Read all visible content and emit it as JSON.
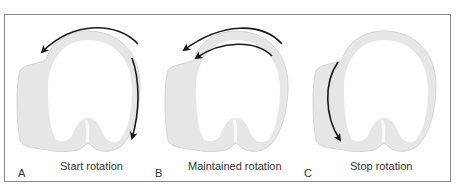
{
  "figure": {
    "panels": [
      {
        "letter": "A",
        "caption": "Start rotation"
      },
      {
        "letter": "B",
        "caption": "Maintained rotation"
      },
      {
        "letter": "C",
        "caption": "Stop rotation"
      }
    ],
    "colors": {
      "frame_border": "#8a8a8a",
      "shape_fill": "#e4e4e4",
      "shape_edge": "#d2d2d2",
      "arrow": "#1a1a1a",
      "text": "#333333"
    }
  }
}
